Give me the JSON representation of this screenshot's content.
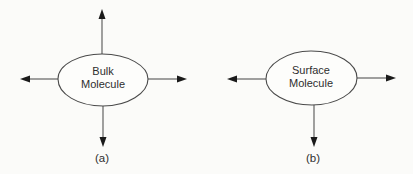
{
  "diagram": {
    "colors": {
      "stroke": "#4a4a4a",
      "arrowhead": "#1a1a1a",
      "background": "#fbfbf9"
    },
    "panels": [
      {
        "id": "a",
        "caption": "(a)",
        "molecule": {
          "line1": "Bulk",
          "line2": "Molecule",
          "shape": "ellipse"
        },
        "arrows": [
          "up",
          "down",
          "left",
          "right"
        ]
      },
      {
        "id": "b",
        "caption": "(b)",
        "molecule": {
          "line1": "Surface",
          "line2": "Molecule",
          "shape": "ellipse"
        },
        "arrows": [
          "down",
          "left",
          "right"
        ]
      }
    ]
  }
}
